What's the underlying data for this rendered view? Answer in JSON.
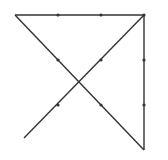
{
  "diagram": {
    "background": "#ffffff",
    "stroke_color": "#333333",
    "dot_color": "#333333",
    "dots": [
      {
        "x": 58,
        "y": 15
      },
      {
        "x": 101,
        "y": 15
      },
      {
        "x": 144,
        "y": 15
      },
      {
        "x": 58,
        "y": 60
      },
      {
        "x": 101,
        "y": 60
      },
      {
        "x": 144,
        "y": 60
      },
      {
        "x": 58,
        "y": 105
      },
      {
        "x": 101,
        "y": 105
      },
      {
        "x": 144,
        "y": 105
      }
    ],
    "path": [
      {
        "x": 15,
        "y": 15
      },
      {
        "x": 144,
        "y": 15
      },
      {
        "x": 144,
        "y": 150
      },
      {
        "x": 15,
        "y": 15
      }
    ],
    "segments": [
      {
        "name": "top-line",
        "x1": 15,
        "y1": 15,
        "x2": 144,
        "y2": 15
      },
      {
        "name": "right-line",
        "x1": 144,
        "y1": 15,
        "x2": 144,
        "y2": 150
      },
      {
        "name": "diagonal-down",
        "x1": 15,
        "y1": 15,
        "x2": 144,
        "y2": 150
      },
      {
        "name": "diagonal-up",
        "x1": 144,
        "y1": 15,
        "x2": 24,
        "y2": 138
      }
    ]
  }
}
